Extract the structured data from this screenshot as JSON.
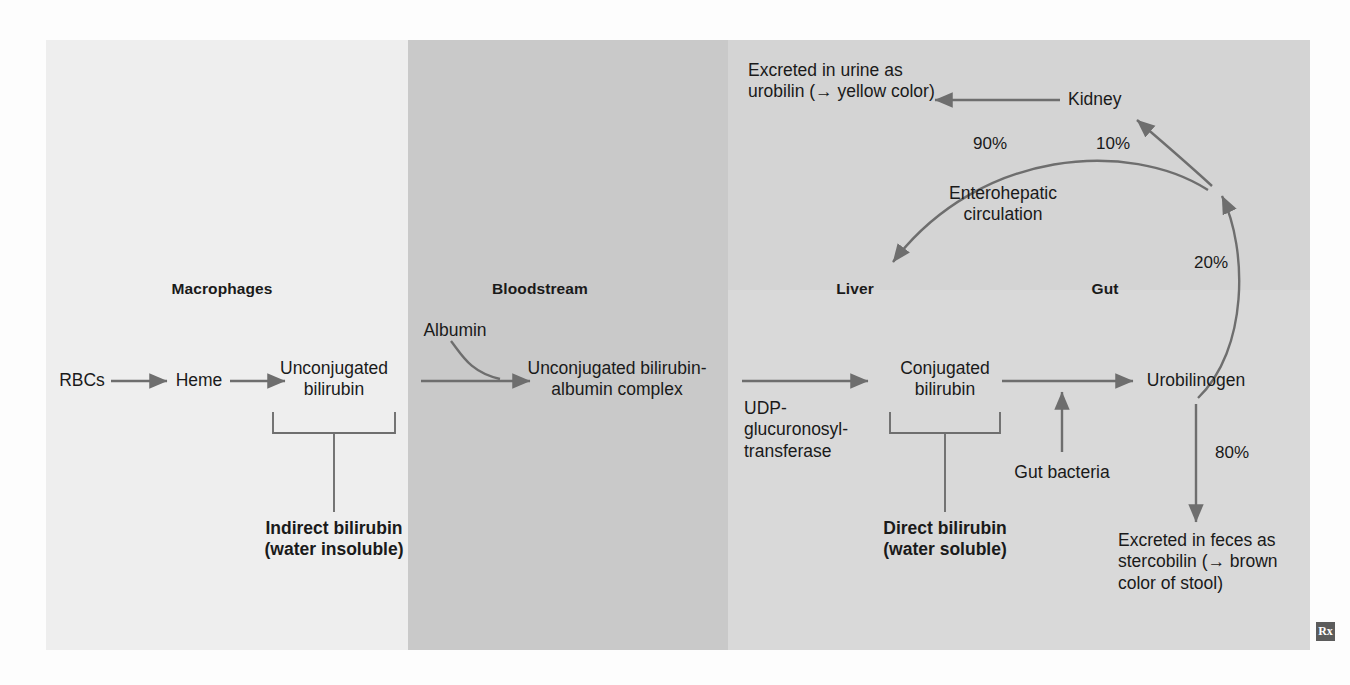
{
  "diagram": {
    "columns": [
      {
        "key": "macrophages",
        "label": "Macrophages"
      },
      {
        "key": "bloodstream",
        "label": "Bloodstream"
      },
      {
        "key": "liver",
        "label": "Liver"
      },
      {
        "key": "gut",
        "label": "Gut"
      }
    ],
    "nodes": {
      "rbcs": "RBCs",
      "heme": "Heme",
      "unconjugated_bilirubin": "Unconjugated\nbilirubin",
      "indirect_bilirubin": "Indirect bilirubin\n(water insoluble)",
      "albumin": "Albumin",
      "unconjugated_albumin_complex": "Unconjugated bilirubin-\nalbumin complex",
      "udp_enzyme": "UDP-\nglucuronosyl-\ntransferase",
      "conjugated_bilirubin": "Conjugated\nbilirubin",
      "direct_bilirubin": "Direct bilirubin\n(water soluble)",
      "gut_bacteria": "Gut bacteria",
      "urobilinogen": "Urobilinogen",
      "kidney": "Kidney",
      "urine_excretion": "Excreted in urine as\nurobilin (→ yellow color)",
      "feces_excretion": "Excreted in feces as\nstercobilin (→ brown\ncolor of stool)",
      "enterohepatic": "Enterohepatic\ncirculation"
    },
    "percentages": {
      "enterohepatic_recycled": "90%",
      "kidney_fraction": "10%",
      "reabsorbed": "20%",
      "feces_fraction": "80%"
    },
    "logo": "Rx",
    "colors": {
      "band_macrophages": "#eeeeee",
      "band_bloodstream": "#c9c9c9",
      "band_liver_gut": "#d9d9d9",
      "arrow": "#6e6e6e",
      "text": "#1a1a1a"
    }
  }
}
